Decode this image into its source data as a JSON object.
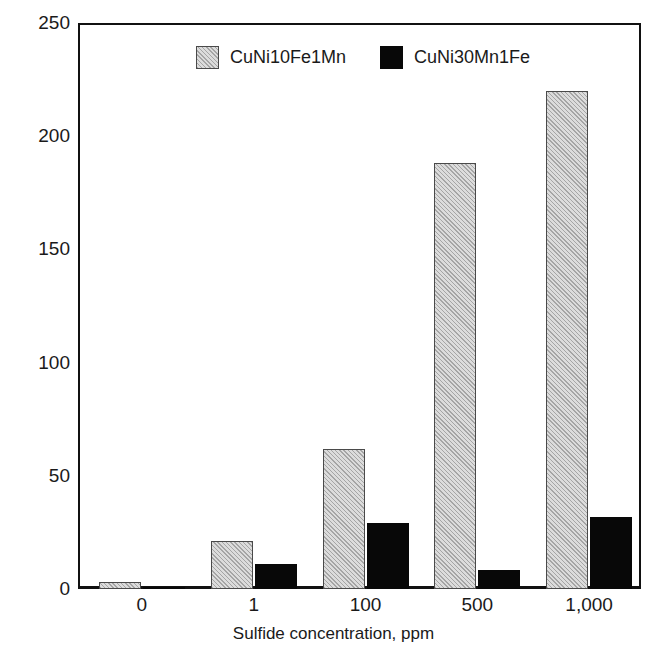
{
  "chart_data": {
    "type": "bar",
    "title": "",
    "subtitle": "",
    "xlabel": "Sulfide concentration, ppm",
    "ylabel": "Corrosion rate, mm/a",
    "categories": [
      "0",
      "1",
      "100",
      "500",
      "1,000"
    ],
    "series": [
      {
        "name": "CuNi10Fe1Mn",
        "values": [
          3,
          21,
          62,
          188,
          220
        ],
        "color": "#dcdcdc",
        "pattern": "diagonal-hatch"
      },
      {
        "name": "CuNi30Mn1Fe",
        "values": [
          1,
          11,
          29,
          8.5,
          32
        ],
        "color": "#080808",
        "pattern": "solid"
      }
    ],
    "ylim": [
      0,
      250
    ],
    "yticks": [
      0,
      50,
      100,
      150,
      200,
      250
    ],
    "ytick_labels": [
      "0",
      "50",
      "100",
      "150",
      "200",
      "250"
    ],
    "grid": false,
    "legend_position": "top-center",
    "axis_color": "#111111",
    "background": "#ffffff"
  },
  "legend": {
    "entries": [
      {
        "label": "CuNi10Fe1Mn",
        "swatch": "hatched-gray-swatch"
      },
      {
        "label": "CuNi30Mn1Fe",
        "swatch": "solid-black-swatch"
      }
    ]
  }
}
